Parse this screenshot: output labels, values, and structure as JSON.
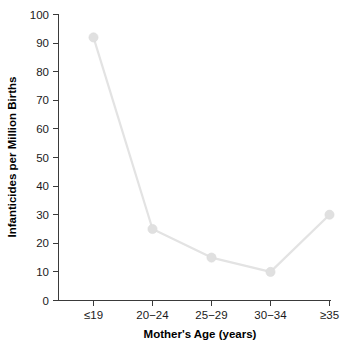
{
  "chart_data": {
    "type": "line",
    "title": "",
    "xlabel": "Mother's Age (years)",
    "ylabel": "Infanticides per Million Births",
    "categories": [
      "≤19",
      "20−24",
      "25−29",
      "30−34",
      "≥35"
    ],
    "values": [
      92,
      25,
      15,
      10,
      30
    ],
    "ylim": [
      0,
      100
    ],
    "yticks": [
      0,
      10,
      20,
      30,
      40,
      50,
      60,
      70,
      80,
      90,
      100
    ],
    "ytick_labels": [
      "0",
      "10",
      "20",
      "30",
      "40",
      "50",
      "60",
      "70",
      "80",
      "90",
      "100"
    ],
    "grid": false,
    "legend": "none",
    "series": [
      {
        "name": "Infanticides per Million Births",
        "values": [
          92,
          25,
          15,
          10,
          30
        ],
        "line_color": "#e3e3e3",
        "marker_color": "#e0e0e0",
        "marker": "circle"
      }
    ]
  },
  "axes": {
    "y_title": "Infanticides per Million Births",
    "x_title": "Mother's Age (years)",
    "y_ticks": [
      {
        "label": "100",
        "value": 100
      },
      {
        "label": "90",
        "value": 90
      },
      {
        "label": "80",
        "value": 80
      },
      {
        "label": "70",
        "value": 70
      },
      {
        "label": "60",
        "value": 60
      },
      {
        "label": "50",
        "value": 50
      },
      {
        "label": "40",
        "value": 40
      },
      {
        "label": "30",
        "value": 30
      },
      {
        "label": "20",
        "value": 20
      },
      {
        "label": "10",
        "value": 10
      },
      {
        "label": "0",
        "value": 0
      }
    ],
    "x_ticks": [
      {
        "label": "≤19"
      },
      {
        "label": "20−24"
      },
      {
        "label": "25−29"
      },
      {
        "label": "30−34"
      },
      {
        "label": "≥35"
      }
    ]
  },
  "colors": {
    "axis": "#3a3a3a",
    "line": "#e3e3e3",
    "marker": "#e0e0e0",
    "text": "#1a1a1a",
    "background": "#ffffff"
  }
}
